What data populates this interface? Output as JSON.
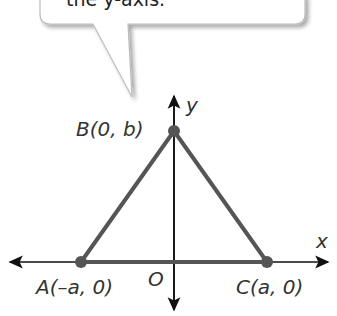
{
  "callout": {
    "text": "the y-axis."
  },
  "diagram": {
    "axes": {
      "x_label": "x",
      "y_label": "y",
      "origin_label": "O"
    },
    "points": [
      {
        "name": "A",
        "label": "A(–a, 0)"
      },
      {
        "name": "B",
        "label": "B(0, b)"
      },
      {
        "name": "C",
        "label": "C(a, 0)"
      }
    ],
    "colors": {
      "triangle": "#555555",
      "axes": "#111111",
      "points": "#555555"
    }
  }
}
